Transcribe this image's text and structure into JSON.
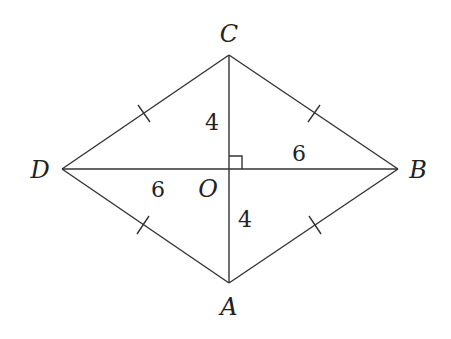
{
  "figure": {
    "vertices": {
      "A": "A",
      "B": "B",
      "C": "C",
      "D": "D"
    },
    "center": "O",
    "segment_labels": {
      "OC": "4",
      "OB": "6",
      "OD": "6",
      "OA": "4"
    },
    "right_angle_at": "O",
    "equal_side_ticks": [
      "DC",
      "CB",
      "DA",
      "AB"
    ],
    "colors": {
      "line": "#333333",
      "background": "#ffffff"
    }
  }
}
